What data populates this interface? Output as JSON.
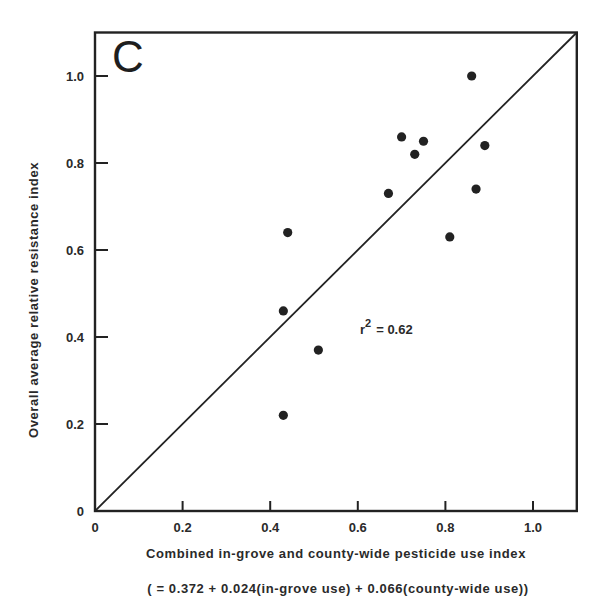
{
  "chart_data": {
    "type": "scatter",
    "panel_label": "C",
    "title": "",
    "xlabel": "Combined in-grove and county-wide pesticide use index",
    "xlabel_formula": "( = 0.372 + 0.024(in-grove use) + 0.066(county-wide use))",
    "ylabel": "Overall average relative resistance index",
    "xlim": [
      0,
      1.1
    ],
    "ylim": [
      0,
      1.1
    ],
    "x_ticks": [
      0,
      0.2,
      0.4,
      0.6,
      0.8,
      1.0
    ],
    "x_tick_labels": [
      "0",
      "0.2",
      "0.4",
      "0.6",
      "0.8",
      "1.0"
    ],
    "y_ticks": [
      0,
      0.2,
      0.4,
      0.6,
      0.8,
      1.0
    ],
    "y_tick_labels": [
      "0",
      "0.2",
      "0.4",
      "0.6",
      "0.8",
      "1.0"
    ],
    "grid": false,
    "legend": null,
    "annotation": "r² = 0.62",
    "annotation_parts": {
      "r": "r",
      "sup": "2",
      "rest": "= 0.62"
    },
    "reference_line": {
      "label": "1:1 line",
      "from": [
        0,
        0
      ],
      "to": [
        1.1,
        1.1
      ]
    },
    "series": [
      {
        "name": "groves",
        "points": [
          {
            "x": 0.43,
            "y": 0.22
          },
          {
            "x": 0.43,
            "y": 0.46
          },
          {
            "x": 0.44,
            "y": 0.64
          },
          {
            "x": 0.51,
            "y": 0.37
          },
          {
            "x": 0.67,
            "y": 0.73
          },
          {
            "x": 0.7,
            "y": 0.86
          },
          {
            "x": 0.73,
            "y": 0.82
          },
          {
            "x": 0.75,
            "y": 0.85
          },
          {
            "x": 0.81,
            "y": 0.63
          },
          {
            "x": 0.86,
            "y": 1.0
          },
          {
            "x": 0.87,
            "y": 0.74
          },
          {
            "x": 0.89,
            "y": 0.84
          }
        ]
      }
    ],
    "colors": {
      "ink": "#222222",
      "background": "#ffffff"
    }
  }
}
